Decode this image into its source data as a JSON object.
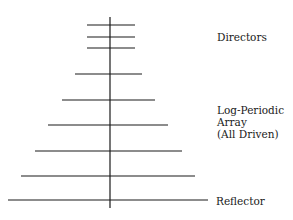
{
  "diagram": {
    "stroke_color": "#1a1a1a",
    "background": "#ffffff",
    "boom": {
      "x": 110,
      "y1": 17,
      "y2": 208
    },
    "elements": [
      {
        "role": "director",
        "y": 25,
        "x1": 87,
        "x2": 135
      },
      {
        "role": "director",
        "y": 37,
        "x1": 87,
        "x2": 135
      },
      {
        "role": "director",
        "y": 48,
        "x1": 87,
        "x2": 135
      },
      {
        "role": "driven",
        "y": 74,
        "x1": 75,
        "x2": 142
      },
      {
        "role": "driven",
        "y": 100,
        "x1": 62,
        "x2": 155
      },
      {
        "role": "driven",
        "y": 125,
        "x1": 48,
        "x2": 168
      },
      {
        "role": "driven",
        "y": 151,
        "x1": 35,
        "x2": 182
      },
      {
        "role": "driven",
        "y": 176,
        "x1": 21,
        "x2": 195
      },
      {
        "role": "reflector",
        "y": 200,
        "x1": 8,
        "x2": 208
      }
    ],
    "labels": {
      "directors": "Directors",
      "lpda_line1": "Log-Periodic",
      "lpda_line2": "Array",
      "lpda_line3": "(All Driven)",
      "reflector": "Reflector"
    }
  }
}
